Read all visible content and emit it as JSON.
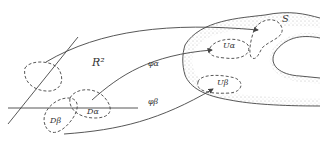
{
  "diagram": {
    "labels": {
      "plane": "R²",
      "surface": "S",
      "map_alpha": "φα",
      "map_beta": "φβ",
      "domain_alpha": "Dα",
      "domain_beta": "Dβ",
      "nbhd_alpha": "Uα",
      "nbhd_beta": "Uβ"
    },
    "colors": {
      "stroke": "#444444",
      "stipple": "#777777",
      "background": "#ffffff"
    }
  }
}
